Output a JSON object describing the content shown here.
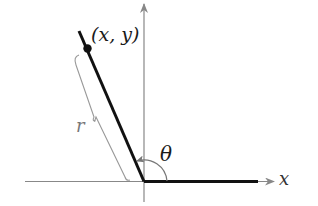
{
  "diagram": {
    "type": "angle-in-standard-position",
    "labels": {
      "point": "(x, y)",
      "theta": "θ",
      "radius": "r",
      "x_axis": "x"
    },
    "elements": {
      "origin": [
        144,
        181
      ],
      "terminal_point": [
        87,
        48
      ],
      "terminal_side_end": [
        79,
        31
      ],
      "initial_side_end": [
        258,
        181
      ]
    },
    "colors": {
      "terminal_side": "#111111",
      "initial_side": "#111111",
      "axes": "#888888",
      "brace": "#999999",
      "arc": "#777777",
      "background": "#ffffff"
    }
  }
}
